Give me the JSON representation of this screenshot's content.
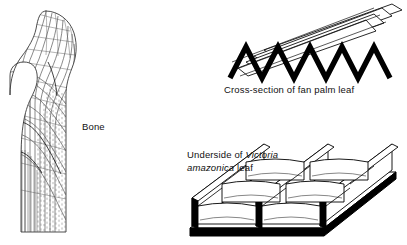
{
  "figure": {
    "width": 407,
    "height": 245,
    "background": "#ffffff",
    "ink": "#000000",
    "hairline": "#555555",
    "style": "line-art biological diagram, black ink on white"
  },
  "panels": [
    {
      "id": "bone",
      "name": "bone-diagram",
      "subject": "proximal femur showing trabecular stress lines",
      "label": "Bone"
    },
    {
      "id": "fan-palm",
      "name": "fan-palm-diagram",
      "subject": "pleated corrugated leaf cross-section",
      "caption": "Cross-section of fan palm leaf"
    },
    {
      "id": "victoria",
      "name": "victoria-amazonica-diagram",
      "subject": "girder-like rib lattice on leaf underside",
      "caption_line1_plain": "Underside of ",
      "caption_line1_italic": "Victoria",
      "caption_line2_italic": "amazonica",
      "caption_line2_plain": " leaf"
    }
  ],
  "bone": {
    "label": "Bone"
  },
  "palm": {
    "caption": "Cross-section of fan palm leaf"
  },
  "victoria": {
    "caption_line1_plain": "Underside of",
    "caption_line1_italic": "Victoria",
    "caption_line2_italic": "amazonica",
    "caption_line2_plain": "leaf"
  }
}
